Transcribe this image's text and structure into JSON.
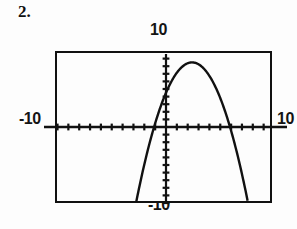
{
  "problem": {
    "number": "2."
  },
  "graph": {
    "window_labels": {
      "top": "10",
      "bottom": "-10",
      "left": "-10",
      "right": "10"
    },
    "colors": {
      "ink": "#111111",
      "background": "#fdfdfd",
      "curve": "#111111"
    }
  },
  "chart_data": {
    "type": "line",
    "title": "",
    "subtitle": "",
    "xlabel": "",
    "ylabel": "",
    "xlim": [
      -10,
      10
    ],
    "ylim": [
      -10,
      10
    ],
    "grid": false,
    "legend": null,
    "x_tick_labels": [
      "-10",
      "10"
    ],
    "y_tick_labels": [
      "-10",
      "10"
    ],
    "x_tick_step": 1,
    "y_tick_step": 1,
    "annotations": [],
    "series": [
      {
        "name": "downward parabola",
        "shape": "parabola-opens-down",
        "vertex": [
          2.4,
          8.5
        ],
        "roots": [
          -1.1,
          5.0
        ],
        "x": [
          -1.6,
          -1.4,
          -1.2,
          -1.0,
          -0.8,
          -0.6,
          -0.4,
          -0.2,
          0.0,
          0.2,
          0.4,
          0.6,
          0.8,
          1.0,
          1.2,
          1.4,
          1.6,
          1.8,
          2.0,
          2.2,
          2.4,
          2.6,
          2.8,
          3.0,
          3.2,
          3.4,
          3.6,
          3.8,
          4.0,
          4.2,
          4.4,
          4.6,
          4.8,
          5.0,
          5.2,
          5.4,
          5.6,
          5.8,
          6.0,
          6.2,
          6.4,
          6.6
        ],
        "y": [
          -10.0,
          -7.39,
          -4.94,
          -2.65,
          -0.52,
          1.45,
          3.26,
          4.91,
          6.4,
          7.73,
          8.9,
          9.91,
          10.0,
          10.0,
          10.0,
          10.0,
          10.0,
          10.0,
          10.0,
          10.0,
          10.0,
          10.0,
          10.0,
          9.91,
          8.9,
          7.73,
          6.4,
          4.91,
          3.26,
          1.45,
          -0.52,
          -2.65,
          -4.94,
          -7.39,
          -10.0,
          -10.0,
          -10.0,
          -10.0,
          -10.0,
          -10.0,
          -10.0,
          -10.0
        ]
      }
    ]
  }
}
